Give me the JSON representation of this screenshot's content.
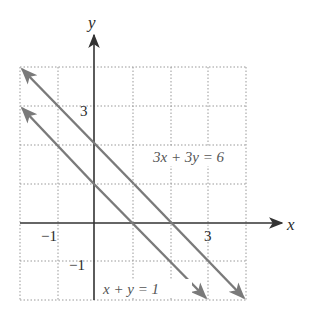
{
  "figure": {
    "axes": {
      "x_label": "x",
      "y_label": "y",
      "x_ticks": [
        {
          "value": -1,
          "label": "−1"
        },
        {
          "value": 3,
          "label": "3"
        }
      ],
      "y_ticks": [
        {
          "value": 3,
          "label": "3"
        },
        {
          "value": -1,
          "label": "−1"
        }
      ],
      "grid_range": {
        "x": [
          -2,
          4
        ],
        "y": [
          -2,
          4
        ]
      }
    },
    "lines": [
      {
        "equation": "3x + 3y = 6",
        "from": [
          -2,
          4
        ],
        "to": [
          4,
          -2
        ]
      },
      {
        "equation": "x + y = 1",
        "from": [
          -2,
          3
        ],
        "to": [
          3,
          -2
        ]
      }
    ],
    "labels": {
      "line1": "3x + 3y = 6",
      "line2": "x + y = 1"
    },
    "colors": {
      "axes": "#333333",
      "lines": "#7a7a7a",
      "grid": "#999999",
      "text": "#555555"
    }
  }
}
